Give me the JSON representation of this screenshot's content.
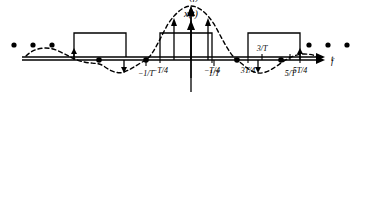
{
  "figure": {
    "background": "#ffffff",
    "ink": "#000000",
    "width": 369,
    "height": 224
  },
  "top_plot": {
    "signal_label": "x(t)",
    "x_axis_label": "t",
    "axis_y": 57,
    "x_axis_start": 22,
    "x_axis_end": 322,
    "y_axis_x": 191,
    "y_axis_top": 22,
    "y_axis_bottom": 92,
    "pulse_top_y": 33,
    "pulses": [
      {
        "name": "pulse-left",
        "x_start": 74,
        "x_end": 126
      },
      {
        "name": "pulse-center",
        "x_start": 160,
        "x_end": 212
      },
      {
        "name": "pulse-right",
        "x_start": 248,
        "x_end": 300
      }
    ],
    "ticks": [
      {
        "label": "−T/4",
        "x": 160
      },
      {
        "label": "−T/4",
        "x": 212
      },
      {
        "label": "3T/4",
        "x": 248
      },
      {
        "label": "5T/4",
        "x": 300
      }
    ],
    "ellipsis_left": [
      14,
      33,
      52
    ],
    "ellipsis_right": [
      309,
      328,
      347
    ],
    "ellipsis_y": 45
  },
  "bottom_plot": {
    "signal_label": "X(f)",
    "x_axis_label": "f",
    "axis_y": 172,
    "x_axis_start": 22,
    "x_axis_end": 322,
    "y_axis_x": 191,
    "y_axis_top": 110,
    "y_axis_bottom": 190,
    "ticks": [
      {
        "label": "−1/T",
        "x": 146,
        "position": "below"
      },
      {
        "label": "1/T",
        "x": 214,
        "position": "below"
      },
      {
        "label": "3/T",
        "x": 262,
        "position": "above"
      },
      {
        "label": "5/T",
        "x": 290,
        "position": "below"
      }
    ],
    "envelope": {
      "type": "sinc",
      "peak_y": 118,
      "description": "dashed sinc envelope with main lobe centered at f = 0 and decaying side lobes"
    },
    "impulses": [
      {
        "x": 74,
        "height": 8,
        "direction": "up"
      },
      {
        "x": 124,
        "height": -9,
        "direction": "down"
      },
      {
        "x": 174,
        "height": 42,
        "direction": "up"
      },
      {
        "x": 191,
        "height": 54,
        "direction": "up"
      },
      {
        "x": 208,
        "height": 42,
        "direction": "up"
      },
      {
        "x": 258,
        "height": -13,
        "direction": "down"
      },
      {
        "x": 300,
        "height": 9,
        "direction": "up"
      }
    ],
    "zero_crossing_dots": [
      {
        "x": 99
      },
      {
        "x": 146
      },
      {
        "x": 237
      },
      {
        "x": 281
      }
    ]
  }
}
